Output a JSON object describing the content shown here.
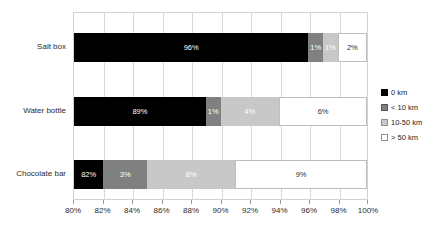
{
  "chart_data": {
    "type": "bar",
    "orientation": "horizontal",
    "stacked": true,
    "title": "",
    "subtitle": "",
    "xlabel": "",
    "ylabel": "",
    "xlim": [
      80,
      100
    ],
    "xtick_labels": [
      "80%",
      "82%",
      "84%",
      "86%",
      "88%",
      "90%",
      "92%",
      "94%",
      "96%",
      "98%",
      "100%"
    ],
    "xtick_values": [
      80,
      82,
      84,
      86,
      88,
      90,
      92,
      94,
      96,
      98,
      100
    ],
    "grid": true,
    "grid_axis": "x",
    "legend_position": "right",
    "categories": [
      "Salt box",
      "Water bottle",
      "Chocolate bar"
    ],
    "series": [
      {
        "name": "0 km",
        "color": "#000000",
        "values": [
          96,
          89,
          82
        ],
        "labels": [
          "96%",
          "89%",
          "82%"
        ]
      },
      {
        "name": "< 10 km",
        "color": "#808080",
        "values": [
          1,
          1,
          3
        ],
        "labels": [
          "1%",
          "1%",
          "3%"
        ]
      },
      {
        "name": "10-50 km",
        "color": "#c8c8c8",
        "values": [
          1,
          4,
          6
        ],
        "labels": [
          "1%",
          "4%",
          "6%"
        ]
      },
      {
        "name": "> 50 km",
        "color": "#ffffff",
        "values": [
          2,
          6,
          9
        ],
        "labels": [
          "2%",
          "6%",
          "9%"
        ]
      }
    ],
    "rows": [
      {
        "category": "Salt box",
        "segments": [
          {
            "series": "0 km",
            "value": 96,
            "label": "96%"
          },
          {
            "series": "< 10 km",
            "value": 1,
            "label": "1%"
          },
          {
            "series": "10-50 km",
            "value": 1,
            "label": "1%"
          },
          {
            "series": "> 50 km",
            "value": 2,
            "label": "2%"
          }
        ]
      },
      {
        "category": "Water bottle",
        "segments": [
          {
            "series": "0 km",
            "value": 89,
            "label": "89%"
          },
          {
            "series": "< 10 km",
            "value": 1,
            "label": "1%"
          },
          {
            "series": "10-50 km",
            "value": 4,
            "label": "4%"
          },
          {
            "series": "> 50 km",
            "value": 6,
            "label": "6%"
          }
        ]
      },
      {
        "category": "Chocolate bar",
        "segments": [
          {
            "series": "0 km",
            "value": 82,
            "label": "82%"
          },
          {
            "series": "< 10 km",
            "value": 3,
            "label": "3%"
          },
          {
            "series": "10-50 km",
            "value": 6,
            "label": "6%"
          },
          {
            "series": "> 50 km",
            "value": 9,
            "label": "9%"
          }
        ]
      }
    ]
  },
  "legend": {
    "items": [
      {
        "label": "0 km",
        "color": "#000000"
      },
      {
        "label": "< 10 km",
        "color": "#808080"
      },
      {
        "label": "10-50 km",
        "color": "#c8c8c8"
      },
      {
        "label": "> 50 km",
        "color": "#ffffff"
      }
    ]
  }
}
